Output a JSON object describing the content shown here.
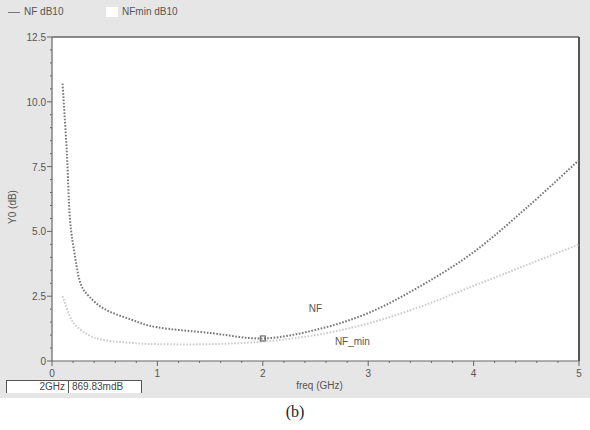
{
  "legend": [
    {
      "label": "NF dB10",
      "swatch": "line"
    },
    {
      "label": "NFmin dB10",
      "swatch": "box"
    }
  ],
  "chart_data": {
    "type": "line",
    "title": "",
    "xlabel": "freq (GHz)",
    "ylabel": "Y0 (dB)",
    "xlim": [
      0,
      5
    ],
    "ylim": [
      0,
      12.5
    ],
    "xticks": [
      "0",
      "1",
      "2",
      "3",
      "4",
      "5"
    ],
    "yticks": [
      "0",
      "2.5",
      "5.0",
      "7.5",
      "10.0",
      "12.5"
    ],
    "grid": false,
    "legend_position": "top-left",
    "series": [
      {
        "name": "NF",
        "legend": "NF dB10",
        "color": "#777777",
        "style": "dotted",
        "x": [
          0.1,
          0.14,
          0.17,
          0.22,
          0.27,
          0.35,
          0.5,
          0.75,
          1.0,
          1.5,
          2.0,
          2.5,
          3.0,
          3.5,
          4.0,
          4.5,
          5.0
        ],
        "y": [
          10.7,
          8.1,
          5.5,
          4.0,
          3.0,
          2.5,
          2.0,
          1.6,
          1.3,
          1.08,
          0.87,
          1.2,
          1.85,
          2.9,
          4.2,
          5.9,
          7.75
        ]
      },
      {
        "name": "NF_min",
        "legend": "NFmin dB10",
        "color": "#cccccc",
        "style": "dotted",
        "x": [
          0.1,
          0.2,
          0.35,
          0.5,
          0.75,
          1.0,
          1.5,
          2.0,
          2.5,
          3.0,
          3.5,
          4.0,
          4.5,
          5.0
        ],
        "y": [
          2.5,
          1.5,
          1.0,
          0.8,
          0.7,
          0.65,
          0.65,
          0.75,
          1.0,
          1.45,
          2.1,
          2.9,
          3.7,
          4.5
        ]
      }
    ],
    "annotations": [
      {
        "text": "NF",
        "x": 2.5,
        "y": 1.9
      },
      {
        "text": "NF_min",
        "x": 2.85,
        "y": 0.6
      }
    ],
    "marker": {
      "x": 2.0,
      "y": 0.86983,
      "freq_label": "2GHz",
      "value_label": "869.83mdB"
    }
  },
  "caption": "(b)"
}
